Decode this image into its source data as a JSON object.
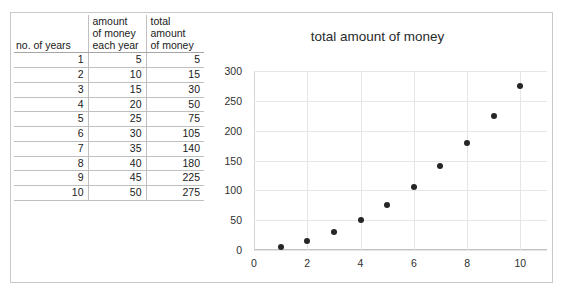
{
  "table": {
    "name": "money-table",
    "headers": [
      {
        "lines": [
          "no. of years"
        ]
      },
      {
        "lines": [
          "amount",
          "of money",
          "each year"
        ]
      },
      {
        "lines": [
          "total",
          "amount",
          "of money"
        ]
      }
    ],
    "rows": [
      [
        "1",
        "5",
        "5"
      ],
      [
        "2",
        "10",
        "15"
      ],
      [
        "3",
        "15",
        "30"
      ],
      [
        "4",
        "20",
        "50"
      ],
      [
        "5",
        "25",
        "75"
      ],
      [
        "6",
        "30",
        "105"
      ],
      [
        "7",
        "35",
        "140"
      ],
      [
        "8",
        "40",
        "180"
      ],
      [
        "9",
        "45",
        "225"
      ],
      [
        "10",
        "50",
        "275"
      ]
    ]
  },
  "chart_data": {
    "type": "scatter",
    "title": "total amount of money",
    "xlabel": "",
    "ylabel": "",
    "x": [
      1,
      2,
      3,
      4,
      5,
      6,
      7,
      8,
      9,
      10
    ],
    "values": [
      5,
      15,
      30,
      50,
      75,
      105,
      140,
      180,
      225,
      275
    ],
    "series": [
      {
        "name": "total amount of money",
        "values": [
          5,
          15,
          30,
          50,
          75,
          105,
          140,
          180,
          225,
          275
        ]
      }
    ],
    "xlim": [
      0,
      11
    ],
    "ylim": [
      0,
      300
    ],
    "xticks": [
      "0",
      "2",
      "4",
      "6",
      "8",
      "10"
    ],
    "xtick_values": [
      0,
      2,
      4,
      6,
      8,
      10
    ],
    "yticks": [
      "0",
      "50",
      "100",
      "150",
      "200",
      "250",
      "300"
    ],
    "ytick_values": [
      0,
      50,
      100,
      150,
      200,
      250,
      300
    ],
    "grid": true,
    "legend": false,
    "marker_color": "#262626",
    "gridline_color": "#e6e6e6"
  }
}
